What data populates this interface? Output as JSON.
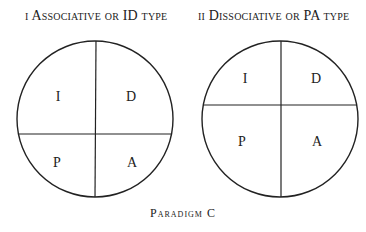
{
  "figure": {
    "left": {
      "numeral": "i",
      "title": "Associative or ID type",
      "quadrants": {
        "top_left": "I",
        "top_right": "D",
        "bottom_left": "P",
        "bottom_right": "A"
      }
    },
    "right": {
      "numeral": "ii",
      "title": "Dissociative or PA type",
      "quadrants": {
        "top_left": "I",
        "top_right": "D",
        "bottom_left": "P",
        "bottom_right": "A"
      }
    },
    "caption": "Paradigm C"
  },
  "colors": {
    "line": "#222222",
    "background": "#ffffff"
  }
}
